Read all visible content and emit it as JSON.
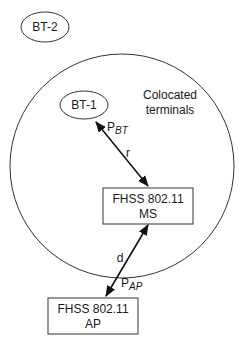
{
  "diagram": {
    "nodes": {
      "bt2": {
        "label": "BT-2"
      },
      "bt1": {
        "label": "BT-1"
      },
      "colocated_region": {
        "label_line1": "Colocated",
        "label_line2": "terminals"
      },
      "ms": {
        "label_line1": "FHSS 802.11",
        "label_line2": "MS"
      },
      "ap": {
        "label_line1": "FHSS 802.11",
        "label_line2": "AP"
      }
    },
    "edges": {
      "bt1_ms": {
        "distance_label": "r",
        "power_label_main": "P",
        "power_label_sub": "BT"
      },
      "ms_ap": {
        "distance_label": "d",
        "power_label_main": "P",
        "power_label_sub": "AP"
      }
    },
    "colors": {
      "stroke": "#333333",
      "arrow": "#111111",
      "text": "#1a1a1a",
      "background": "#ffffff"
    }
  }
}
